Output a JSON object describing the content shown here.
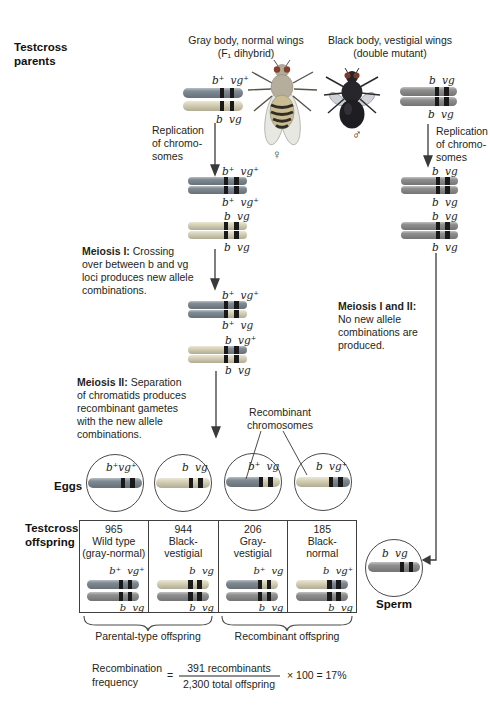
{
  "palette": {
    "egg_dark": "#7f8a93",
    "egg_light": "#d9d3b8",
    "sperm_gray": "#8f8f8f",
    "band": "#191919",
    "arrow": "#3a3a3a",
    "fly_gray_body": "#b5ae9c",
    "fly_black_body": "#232327"
  },
  "parents_label": {
    "line1": "Testcross",
    "line2": "parents"
  },
  "female_parent": {
    "title1": "Gray body, normal wings",
    "title2": "(F₁ dihybrid)",
    "sex": "♀",
    "allele_top": "b⁺ vg⁺",
    "allele_bottom": "b vg"
  },
  "male_parent": {
    "title1": "Black body, vestigial wings",
    "title2": "(double mutant)",
    "sex": "♂",
    "allele_top": "b vg",
    "allele_bottom": "b vg"
  },
  "replication_left": {
    "line1": "Replication",
    "line2": "of chromo-",
    "line3": "somes"
  },
  "replication_right": {
    "line1": "Replication",
    "line2": "of chromo-",
    "line3": "somes"
  },
  "post_replication_left": {
    "pair1_top": "b⁺ vg⁺",
    "pair1_bottom": "b⁺ vg⁺",
    "pair2_top": "b vg",
    "pair2_bottom": "b vg"
  },
  "post_replication_right": {
    "pair1_top": "b vg",
    "pair1_bottom": "b vg",
    "pair2_top": "b vg",
    "pair2_bottom": "b vg"
  },
  "meiosis1": {
    "bold": "Meiosis I:",
    "line1_rest": "Crossing",
    "line2": "over between b and vg",
    "line3": "loci produces new allele",
    "line4": "combinations."
  },
  "post_meiosis1": {
    "chromA_top": "b⁺ vg⁺",
    "chromA_bottom": "b⁺ vg",
    "chromB_top": "b vg⁺",
    "chromB_bottom": "b vg"
  },
  "meiosis2": {
    "bold": "Meiosis II:",
    "line1_rest": "Separation",
    "line2": "of chromatids produces",
    "line3": "recombinant gametes",
    "line4": "with the new allele",
    "line5": "combinations."
  },
  "meiosis12": {
    "bold": "Meiosis I and II:",
    "line1": "No new allele",
    "line2": "combinations are",
    "line3": "produced."
  },
  "recombinant_callout": {
    "line1": "Recombinant",
    "line2": "chromosomes"
  },
  "eggs": {
    "label": "Eggs",
    "circles": [
      {
        "allele": "b⁺vg⁺"
      },
      {
        "allele": "b vg"
      },
      {
        "allele": "b⁺ vg"
      },
      {
        "allele": "b vg⁺"
      }
    ]
  },
  "offspring": {
    "label_line1": "Testcross",
    "label_line2": "offspring",
    "columns": [
      {
        "count": "965",
        "name1": "Wild type",
        "name2": "(gray-normal)",
        "allele_top": "b⁺ vg⁺",
        "allele_bottom": "b vg"
      },
      {
        "count": "944",
        "name1": "Black-",
        "name2": "vestigial",
        "allele_top": "b vg",
        "allele_bottom": "b vg"
      },
      {
        "count": "206",
        "name1": "Gray-",
        "name2": "vestigial",
        "allele_top": "b⁺ vg",
        "allele_bottom": "b vg"
      },
      {
        "count": "185",
        "name1": "Black-",
        "name2": "normal",
        "allele_top": "b vg⁺",
        "allele_bottom": "b vg"
      }
    ],
    "brace_left_label": "Parental-type offspring",
    "brace_right_label": "Recombinant offspring"
  },
  "sperm": {
    "allele": "b vg",
    "label": "Sperm"
  },
  "formula": {
    "lhs1": "Recombination",
    "lhs2": "frequency",
    "eq": "=",
    "numerator": "391 recombinants",
    "denominator": "2,300 total offspring",
    "rhs": "× 100 = 17%"
  }
}
